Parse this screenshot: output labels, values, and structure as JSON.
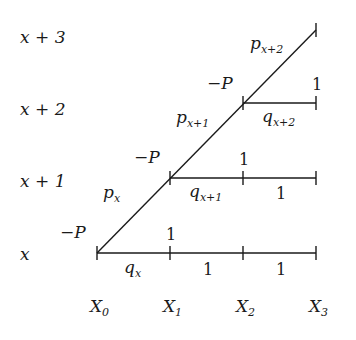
{
  "row_labels": [
    "x + 3",
    "x + 2",
    "x + 1",
    "x"
  ],
  "column_labels": [
    {
      "base": "X",
      "sub": "0"
    },
    {
      "base": "X",
      "sub": "1"
    },
    {
      "base": "X",
      "sub": "2"
    },
    {
      "base": "X",
      "sub": "3"
    }
  ],
  "nodes": {
    "minus_p_0": "−P",
    "minus_p_1": "−P",
    "minus_p_2": "−P"
  },
  "diagonal_labels": [
    {
      "base": "p",
      "sub": "x"
    },
    {
      "base": "p",
      "sub": "x+1"
    },
    {
      "base": "p",
      "sub": "x+2"
    }
  ],
  "horizontal_labels": {
    "row_x": {
      "q": {
        "base": "q",
        "sub": "x"
      },
      "seg2": "1",
      "seg3": "1"
    },
    "row_x1": {
      "q": {
        "base": "q",
        "sub": "x+1"
      },
      "seg3": "1"
    },
    "row_x2": {
      "q": {
        "base": "q",
        "sub": "x+2"
      }
    }
  },
  "payoffs": {
    "at_x1_row_x": "1",
    "at_x2_row_x1": "1",
    "at_x3_row_x2": "1"
  }
}
